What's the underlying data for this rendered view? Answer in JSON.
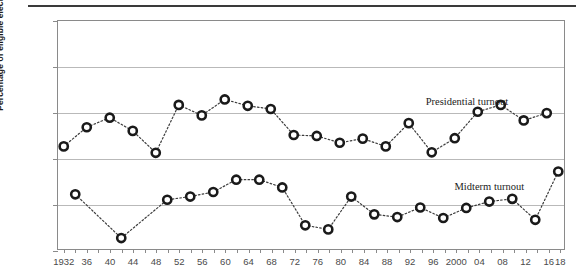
{
  "chart_data": {
    "type": "line",
    "title": "",
    "xlabel": "",
    "ylabel": "Percentage of eligible electorate",
    "ylim": [
      30,
      80
    ],
    "xlim": [
      1931,
      2019
    ],
    "yticks": [
      30,
      40,
      50,
      60,
      70,
      80
    ],
    "ytick_labels": [
      "30",
      "40",
      "50",
      "60",
      "70",
      "80"
    ],
    "grid": true,
    "legend_position": "inline-annotations",
    "xtick_labels": [
      "1932",
      "36",
      "40",
      "44",
      "48",
      "52",
      "56",
      "60",
      "64",
      "68",
      "72",
      "76",
      "80",
      "84",
      "88",
      "92",
      "96",
      "2000",
      "04",
      "08",
      "12",
      "16",
      "18"
    ],
    "xtick_values": [
      1932,
      1936,
      1940,
      1944,
      1948,
      1952,
      1956,
      1960,
      1964,
      1968,
      1972,
      1976,
      1980,
      1984,
      1988,
      1992,
      1996,
      2000,
      2004,
      2008,
      2012,
      2016,
      2018
    ],
    "minor_xticks": [
      1934,
      1938,
      1942,
      1946,
      1950,
      1954,
      1958,
      1962,
      1966,
      1970,
      1974,
      1978,
      1982,
      1986,
      1990,
      1994,
      1998,
      2002,
      2006,
      2010,
      2014,
      2018
    ],
    "series": [
      {
        "name": "Presidential turnout",
        "label_x": 2000,
        "marker": "open-circle",
        "x": [
          1932,
          1936,
          1940,
          1944,
          1948,
          1952,
          1956,
          1960,
          1964,
          1968,
          1972,
          1976,
          1980,
          1984,
          1988,
          1992,
          1996,
          2000,
          2004,
          2008,
          2012,
          2016
        ],
        "values": [
          52.5,
          56.7,
          58.8,
          55.9,
          51.1,
          61.6,
          59.3,
          62.8,
          61.4,
          60.7,
          55.0,
          54.8,
          53.3,
          54.2,
          52.5,
          57.6,
          51.2,
          54.3,
          60.1,
          61.6,
          58.2,
          59.8
        ]
      },
      {
        "name": "Midterm turnout",
        "label_x": 2000,
        "marker": "open-circle",
        "x": [
          1934,
          1942,
          1950,
          1954,
          1958,
          1962,
          1966,
          1970,
          1974,
          1978,
          1982,
          1986,
          1990,
          1994,
          1998,
          2002,
          2006,
          2010,
          2014,
          2018
        ],
        "values": [
          42.0,
          32.4,
          40.8,
          41.5,
          42.5,
          45.2,
          45.2,
          43.5,
          35.2,
          34.3,
          41.5,
          37.6,
          37.0,
          39.1,
          36.8,
          39.0,
          40.4,
          41.0,
          36.4,
          47.0
        ]
      }
    ]
  },
  "annotations": {
    "presidential_label": "Presidential turnout",
    "midterm_label": "Midterm turnout"
  },
  "axis": {
    "y_title": "Percentage of eligible electorate"
  },
  "colors": {
    "marker_stroke": "#1a1a1a",
    "marker_fill": "#ffffff",
    "connector": "#3c3c3c",
    "gridline": "#b9b9b9",
    "frame": "#8a8a8a",
    "text": "#231f20",
    "top_rule": "#3a3a3a"
  }
}
